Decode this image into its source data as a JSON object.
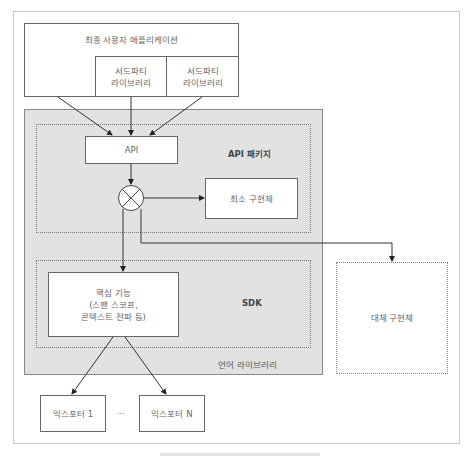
{
  "diagram": {
    "end_user_app": "최종 사용자 애플리케이션",
    "third_party_libs": [
      {
        "line1": "서드파티",
        "line2": "라이브러리"
      },
      {
        "line1": "서드파티",
        "line2": "라이브러리"
      }
    ],
    "api_box": "API",
    "api_package_label": "API 패키지",
    "minimal_impl": "최소 구현체",
    "core_features": {
      "line1": "핵심 기능",
      "line2": "(스팬 스코프,",
      "line3": "콘텍스트 전파 등)"
    },
    "sdk_label": "SDK",
    "language_library_label": "언어 라이브러리",
    "alt_impl": "대체 구현체",
    "exporters": [
      "익스포터 1",
      "익스포터 N"
    ],
    "ellipsis": "...",
    "colors": {
      "language_library_bg": "#e2e2e2",
      "border": "#666666",
      "text": "#666666"
    }
  }
}
